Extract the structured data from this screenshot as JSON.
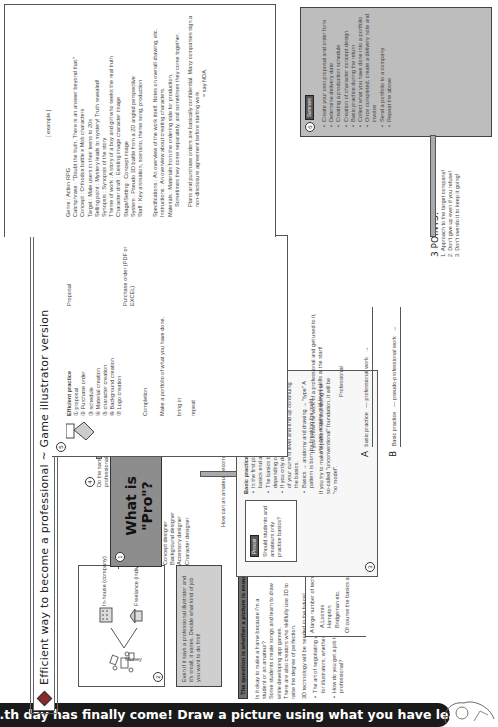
{
  "title": "Efficient way to become a professional ~ Game illustrator version",
  "banner": "...th day has finally come! Draw a picture using what you have learned so far",
  "section1": {
    "num": "1",
    "heading": "What is \"Pro\"?",
    "roles": [
      "Concept designer",
      "Background designer",
      "Accessory designer",
      "Character designer"
    ],
    "note4": {
      "num": "4",
      "text": "Do the same thing as a professional job"
    }
  },
  "section2": {
    "num": "2",
    "money": "Money",
    "inhouse": "In-house (company)",
    "freelance": "Freelance (individual)",
    "tip": "Even if it says a professional illustrator and it's small, it varies. Decide what kind of job you want to do first!"
  },
  "question": {
    "heading": "The question is whether a picture is enough",
    "p1": "Is it okay to make a frame because I'm a student or an amateur?",
    "p2": "Some students create songs and learn to draw while developing app games.",
    "p3": "There are also creators who skillfully use 3D to raise the degree of perfection.",
    "p4": "3D technology will be needed in the future!",
    "b1": "The art of negotiating with clients is essential for illustrators, whether freelance or in-house.",
    "b2": "How do you get a job to become a professional?"
  },
  "manuals": {
    "intro": "A large number of technical manuals",
    "items": [
      "A.Loomis",
      "Hampton",
      "Bridgeman etc."
    ],
    "note": "Of course the basics are important!"
  },
  "section3": {
    "num": "3",
    "bridge": "How can an amateur become a pro?",
    "present_tag": "Present",
    "question": "Should students and amateurs only practice basics?",
    "claim": "Basic practice ≠ professional work",
    "bullets": [
      "In the first place, I don't know where the basics end and where the practice starts.",
      "The basics that can be used change depending on the work content and design.",
      "If you only do the basics, you will lose track of your current level and end up continuing the basics.",
      "Basics → anatomy and drawing → \"type\" A pattern is born by breaking the mold."
    ],
    "closing": "If you try to make a pattern without doing the so-called \"unconventional\" foundation, it will be \"no model\"."
  },
  "compare": {
    "intro": "If you know the work of a professional and get used to it, you can acquire mid-level skills at the start!",
    "professional": "Professional",
    "A": {
      "label": "A",
      "basic": "basic practice",
      "target": "professional work"
    },
    "B": {
      "label": "B",
      "basic": "Basic practice",
      "target": "pseudo-professional work"
    }
  },
  "points": {
    "title": "3 POINTS!",
    "items": [
      "1. Approach to the target company!",
      "2. Don't give up even if you refuse!",
      "3. Don't overdo it to keep it going!"
    ]
  },
  "section5": {
    "num": "5",
    "heading": "Efficient practice",
    "steps": [
      "① proposal",
      "② Purchase order",
      "③ schedule",
      "④ Material creation",
      "⑤ character creation",
      "⑥ Background creation",
      "⑦ Logo creation"
    ],
    "flow": [
      "Completion",
      "Make a portfolio of what you have done.",
      "bring in"
    ],
    "repeat": "repeat",
    "proposal": "Proposal",
    "purchase_order": "Purchase order (PDF or EXCEL)"
  },
  "example": {
    "heading": "[ example ]",
    "rows": [
      {
        "k": "Genre",
        "v": ": Action RPG"
      },
      {
        "k": "Catchphrase",
        "v": ": \"Doubt the truth. There is an answer beyond that.\""
      },
      {
        "k": "Concept",
        "v": ": Orthodox battle x Mob characters"
      },
      {
        "k": "Target",
        "v": ": Male users in their teens to 20s"
      },
      {
        "k": "Selling point",
        "v": ": Mystery leads to mystery! Truth revealed!"
      },
      {
        "k": "Synopsis",
        "v": ": Synopsis of the story"
      },
      {
        "k": "Theme of work",
        "v": ": A story of a boy and girl who seeks the real truth"
      },
      {
        "k": "Character draft",
        "v": ": Existing image character image"
      },
      {
        "k": "Stage/Setting",
        "v": ": Concept image"
      },
      {
        "k": "System",
        "v": ": Pseudo 3D battle from a 2D angled perspective"
      },
      {
        "k": "Staff",
        "v": ": Key animation, scenario, theme song, production"
      }
    ],
    "po_rows": [
      {
        "k": "Specifications",
        "v": ": An overview of the work itself. Notes on overall drawing, etc."
      },
      {
        "k": "Instructions",
        "v": ": An overview about creating characters."
      },
      {
        "k": "Materials",
        "v": ": Materials from the ordering side for production."
      }
    ],
    "po_note": "Sometimes they come separately, and sometimes they come together.",
    "nda_note": "Plans and purchase orders are basically confidential. Many companies sign a non-disclosure agreement before starting work.",
    "nda_eq": "= say NDA."
  },
  "summary": {
    "num": "6",
    "tag": "Summary",
    "items": [
      "Create your own proposal and order form",
      "Determine delivery date",
      "Creating a production schedule",
      "Creation of character concept design",
      "Basic practice during the return",
      "Collect what you have done into a portfolio",
      "Once completed, create a delivery note and invoice",
      "Send a portfolio to a company",
      "Repeat the above"
    ]
  },
  "colors": {
    "gray_box": "#bdbdbd",
    "pro_box": "#8d8d8d",
    "banner": "#1a1a1a",
    "accent": "#8a2a2a"
  }
}
